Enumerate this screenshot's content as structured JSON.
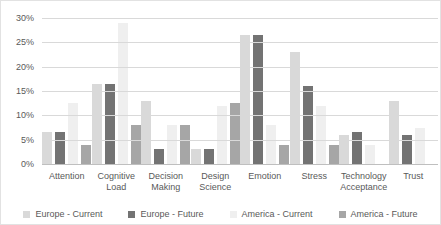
{
  "chart_data": {
    "type": "bar",
    "title": "",
    "xlabel": "",
    "ylabel": "",
    "categories": [
      "Attention",
      "Cognitive Load",
      "Decision Making",
      "Design Science",
      "Emotion",
      "Stress",
      "Technology Acceptance",
      "Trust"
    ],
    "series": [
      {
        "name": "Europe - Current",
        "color": "#d9d9d9",
        "values": [
          6.5,
          16.5,
          13,
          3,
          26.5,
          23,
          6,
          13
        ]
      },
      {
        "name": "Europe - Future",
        "color": "#737373",
        "values": [
          6.5,
          16.5,
          3,
          3,
          26.5,
          16,
          6.5,
          6
        ]
      },
      {
        "name": "America - Current",
        "color": "#efefef",
        "values": [
          12.5,
          29,
          8,
          12,
          8,
          12,
          4,
          7.5
        ]
      },
      {
        "name": "America - Future",
        "color": "#a6a6a6",
        "values": [
          4,
          8,
          8,
          12.5,
          4,
          4,
          0,
          0
        ]
      }
    ],
    "ylim": [
      0,
      30
    ],
    "y_ticks": [
      "0%",
      "5%",
      "10%",
      "15%",
      "20%",
      "25%",
      "30%"
    ],
    "grid": true,
    "gridline_color": "#d9d9d9",
    "axis_text_color": "#595959",
    "legend_position": "bottom"
  }
}
